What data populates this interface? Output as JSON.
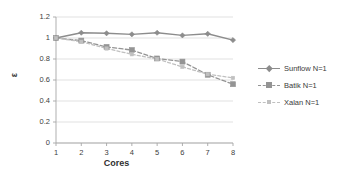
{
  "chart_data": {
    "type": "line",
    "title": "",
    "xlabel": "Cores",
    "ylabel": "ε",
    "x": [
      1,
      2,
      3,
      4,
      5,
      6,
      7,
      8
    ],
    "categories": [
      "1",
      "2",
      "3",
      "4",
      "5",
      "6",
      "7",
      "8"
    ],
    "xlim": [
      1,
      8
    ],
    "ylim": [
      0,
      1.2
    ],
    "yticks": [
      "0",
      "0.2",
      "0.4",
      "0.6",
      "0.8",
      "1",
      "1.2"
    ],
    "ytick_values": [
      0,
      0.2,
      0.4,
      0.6,
      0.8,
      1,
      1.2
    ],
    "grid": true,
    "grid_axis": "y",
    "legend_position": "right",
    "series": [
      {
        "name": "Sunflow N=1",
        "values": [
          1.0,
          1.05,
          1.045,
          1.035,
          1.05,
          1.025,
          1.04,
          0.98
        ],
        "color": "#8c8c8c",
        "style": "solid",
        "marker": "diamond"
      },
      {
        "name": "Batik N=1",
        "values": [
          1.0,
          0.975,
          0.915,
          0.885,
          0.805,
          0.775,
          0.65,
          0.56
        ],
        "color": "#949494",
        "style": "dashed",
        "marker": "square"
      },
      {
        "name": "Xalan N=1",
        "values": [
          1.0,
          0.965,
          0.9,
          0.845,
          0.8,
          0.725,
          0.655,
          0.62
        ],
        "color": "#c0c0c0",
        "style": "dashed",
        "marker": "square-small"
      }
    ]
  },
  "axes": {
    "x_title": "Cores",
    "y_title": "ε",
    "x_tick_labels": [
      "1",
      "2",
      "3",
      "4",
      "5",
      "6",
      "7",
      "8"
    ],
    "y_tick_labels": [
      "1.2",
      "1",
      "0.8",
      "0.6",
      "0.4",
      "0.2",
      "0"
    ]
  },
  "legend": {
    "entries": [
      {
        "label": "Sunflow N=1"
      },
      {
        "label": "Batik N=1"
      },
      {
        "label": "Xalan N=1"
      }
    ]
  },
  "colors": {
    "series_sunflow": "#8c8c8c",
    "series_batik": "#949494",
    "series_xalan": "#c0c0c0",
    "grid": "#d9d9d9",
    "axis": "#a6a6a6",
    "text": "#3a3a3a",
    "background": "#ffffff"
  }
}
